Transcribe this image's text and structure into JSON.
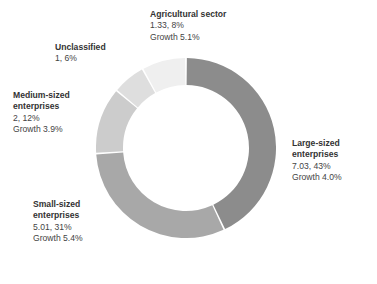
{
  "chart_data": {
    "type": "pie",
    "variant": "donut",
    "title": "",
    "subtitle": "",
    "xlabel": "",
    "ylabel": "",
    "legend_position": "none",
    "grid": false,
    "labels_placement": "outside-callout",
    "total_value": 16.37,
    "categories": [
      "Large-sized enterprises",
      "Small-sized enterprises",
      "Medium-sized enterprises",
      "Unclassified",
      "Agricultural sector"
    ],
    "values": [
      7.03,
      5.01,
      2,
      1,
      1.33
    ],
    "percentages": [
      43,
      31,
      12,
      6,
      8
    ],
    "growth": [
      "4.0%",
      "5.4%",
      "3.9%",
      null,
      "5.1%"
    ],
    "colors": [
      "#8c8c8c",
      "#a8a8a8",
      "#cccccc",
      "#dedede",
      "#efefef"
    ],
    "slices": [
      {
        "name": "Large-sized enterprises",
        "value": 7.03,
        "percent": 43,
        "growth": "4.0%",
        "color": "#8c8c8c",
        "start_angle": 0,
        "sweep_angle": 154.8
      },
      {
        "name": "Small-sized enterprises",
        "value": 5.01,
        "percent": 31,
        "growth": "5.4%",
        "color": "#a8a8a8",
        "start_angle": 154.8,
        "sweep_angle": 111.6
      },
      {
        "name": "Medium-sized enterprises",
        "value": 2,
        "percent": 12,
        "growth": "3.9%",
        "color": "#cccccc",
        "start_angle": 266.4,
        "sweep_angle": 43.2
      },
      {
        "name": "Unclassified",
        "value": 1,
        "percent": 6,
        "growth": null,
        "color": "#dedede",
        "start_angle": 309.6,
        "sweep_angle": 21.6
      },
      {
        "name": "Agricultural sector",
        "value": 1.33,
        "percent": 8,
        "growth": "5.1%",
        "color": "#efefef",
        "start_angle": 331.2,
        "sweep_angle": 28.8
      }
    ]
  },
  "labels": {
    "agricultural": {
      "title": "Agricultural sector",
      "value_line": "1.33, 8%",
      "growth_line": "Growth 5.1%"
    },
    "unclassified": {
      "title": "Unclassified",
      "value_line": "1, 6%"
    },
    "medium": {
      "title_line1": "Medium-sized",
      "title_line2": "enterprises",
      "value_line": "2, 12%",
      "growth_line": "Growth 3.9%"
    },
    "small": {
      "title_line1": "Small-sized",
      "title_line2": "enterprises",
      "value_line": "5.01, 31%",
      "growth_line": "Growth 5.4%"
    },
    "large": {
      "title_line1": "Large-sized",
      "title_line2": "enterprises",
      "value_line": "7.03, 43%",
      "growth_line": "Growth 4.0%"
    }
  },
  "caption": {
    "text": ""
  },
  "style": {
    "background": "#ffffff",
    "text_color": "#3f3f3f",
    "heading_color": "#333333",
    "slice_gap_color": "#ffffff"
  }
}
